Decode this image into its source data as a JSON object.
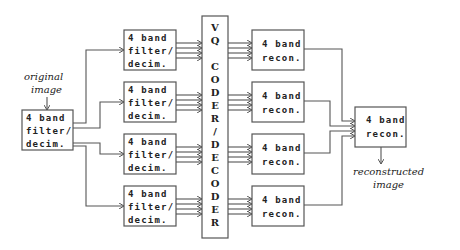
{
  "diagram": {
    "input_label": [
      "original",
      "image"
    ],
    "output_label": [
      "reconstructed",
      "image"
    ],
    "first_stage": {
      "lines": [
        "4 band",
        "filter/",
        "decim."
      ]
    },
    "filter_boxes": [
      {
        "lines": [
          "4 band",
          "filter/",
          "decim."
        ]
      },
      {
        "lines": [
          "4 band",
          "filter/",
          "decim."
        ]
      },
      {
        "lines": [
          "4 band",
          "filter/",
          "decim."
        ]
      },
      {
        "lines": [
          "4 band",
          "filter/",
          "decim."
        ]
      }
    ],
    "coder": {
      "letters": [
        "V",
        "Q",
        "",
        "C",
        "O",
        "D",
        "E",
        "R",
        "/",
        "D",
        "E",
        "C",
        "O",
        "D",
        "E",
        "R"
      ],
      "label": "VQ CODER/DECODER"
    },
    "recon_boxes": [
      {
        "lines": [
          "4 band",
          "recon."
        ]
      },
      {
        "lines": [
          "4 band",
          "recon."
        ]
      },
      {
        "lines": [
          "4 band",
          "recon."
        ]
      },
      {
        "lines": [
          "4 band",
          "recon."
        ]
      }
    ],
    "final_stage": {
      "lines": [
        "4 band",
        "recon."
      ]
    }
  }
}
